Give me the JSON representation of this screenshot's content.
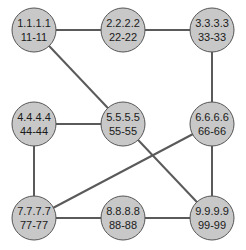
{
  "diagram": {
    "type": "network-graph",
    "node_fill": "#c8c8c8",
    "node_stroke": "#555555",
    "edge_color": "#5a5a5a",
    "nodes": [
      {
        "id": "n1",
        "line1": "1.1.1.1",
        "line2": "11-11",
        "x": 34,
        "y": 30
      },
      {
        "id": "n2",
        "line1": "2.2.2.2",
        "line2": "22-22",
        "x": 123,
        "y": 30
      },
      {
        "id": "n3",
        "line1": "3.3.3.3",
        "line2": "33-33",
        "x": 212,
        "y": 30
      },
      {
        "id": "n4",
        "line1": "4.4.4.4",
        "line2": "44-44",
        "x": 34,
        "y": 124
      },
      {
        "id": "n5",
        "line1": "5.5.5.5",
        "line2": "55-55",
        "x": 123,
        "y": 124
      },
      {
        "id": "n6",
        "line1": "6.6.6.6",
        "line2": "66-66",
        "x": 212,
        "y": 124
      },
      {
        "id": "n7",
        "line1": "7.7.7.7",
        "line2": "77-77",
        "x": 34,
        "y": 218
      },
      {
        "id": "n8",
        "line1": "8.8.8.8",
        "line2": "88-88",
        "x": 123,
        "y": 218
      },
      {
        "id": "n9",
        "line1": "9.9.9.9",
        "line2": "99-99",
        "x": 212,
        "y": 218
      }
    ],
    "edges": [
      [
        "n1",
        "n2"
      ],
      [
        "n2",
        "n3"
      ],
      [
        "n1",
        "n5"
      ],
      [
        "n3",
        "n6"
      ],
      [
        "n4",
        "n5"
      ],
      [
        "n4",
        "n7"
      ],
      [
        "n5",
        "n9"
      ],
      [
        "n6",
        "n7"
      ],
      [
        "n6",
        "n9"
      ],
      [
        "n7",
        "n8"
      ],
      [
        "n8",
        "n9"
      ]
    ]
  }
}
